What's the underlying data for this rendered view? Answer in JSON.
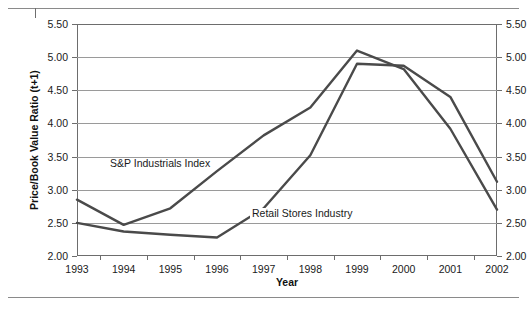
{
  "chart_data": {
    "type": "line",
    "title": "",
    "xlabel": "Year",
    "ylabel": "Price/Book Value Ratio (t+1)",
    "x": [
      1993,
      1994,
      1995,
      1996,
      1997,
      1998,
      1999,
      2000,
      2001,
      2002
    ],
    "xlim": [
      1993,
      2002
    ],
    "ylim": [
      2.0,
      5.5
    ],
    "ytick_labels": [
      "5.50",
      "5.00",
      "4.50",
      "4.00",
      "3.50",
      "3.00",
      "2.50",
      "2.00"
    ],
    "ytick_values": [
      5.5,
      5.0,
      4.5,
      4.0,
      3.5,
      3.0,
      2.5,
      2.0
    ],
    "xtick_labels": [
      "1993",
      "1994",
      "1995",
      "1996",
      "1997",
      "1998",
      "1999",
      "2000",
      "2001",
      "2002"
    ],
    "grid": "horizontal",
    "legend_position": "inline-annotations",
    "dual_y_axis": true,
    "series": [
      {
        "name": "S&P Industrials Index",
        "values": [
          2.5,
          2.37,
          2.32,
          2.28,
          2.72,
          3.52,
          4.9,
          4.87,
          4.4,
          3.12
        ],
        "color": "#4a4a4a"
      },
      {
        "name": "Retail Stores Industry",
        "values": [
          2.85,
          2.47,
          2.72,
          3.28,
          3.82,
          4.24,
          5.1,
          4.82,
          3.92,
          2.7
        ],
        "color": "#4a4a4a"
      }
    ],
    "annotations": [
      {
        "text": "S&P Industrials Index",
        "series": "S&P Industrials Index"
      },
      {
        "text": "Retail Stores Industry",
        "series": "Retail Stores Industry"
      }
    ]
  },
  "axes": {
    "x_title": "Year",
    "y_title": "Price/Book Value Ratio (t+1)"
  },
  "colors": {
    "line": "#4a4a4a",
    "grid": "#9a9a9a",
    "frame": "#6d6d6d",
    "text": "#1a1a1a",
    "rule": "#8a8a8a"
  }
}
